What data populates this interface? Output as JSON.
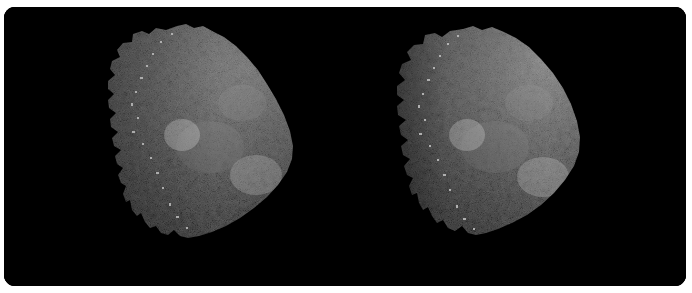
{
  "image": {
    "kind": "stereo-pair-photograph",
    "subject": "asteroid",
    "subject_name": "Bennu",
    "view_description": "Side-by-side stereo pair of a dark, rubble-pile asteroid lit from the right, seen against empty black space",
    "panel": {
      "background_color": "#000000",
      "page_background_color": "#ffffff",
      "corner_radius_px": 11,
      "width_px": 682,
      "height_px": 279
    },
    "frames": [
      {
        "id": "left",
        "label": "Left-eye view",
        "body_label": "asteroid-left",
        "center_x_pct": 65,
        "center_y_pct": 48,
        "terminator_side": "left",
        "illumination_direction": "from the right"
      },
      {
        "id": "right",
        "label": "Right-eye view",
        "body_label": "asteroid-right",
        "center_x_pct": 48,
        "center_y_pct": 48,
        "terminator_side": "left",
        "illumination_direction": "from the right"
      }
    ],
    "surface": {
      "description": "Heavily boulder-strewn regolith with bright angular rocks and deep black shadows",
      "bright_tone": "#e8e8e8",
      "mid_tone": "#9a9a9a",
      "dark_tone": "#3a3a3a",
      "shadow_tone": "#000000"
    },
    "caption": ""
  }
}
